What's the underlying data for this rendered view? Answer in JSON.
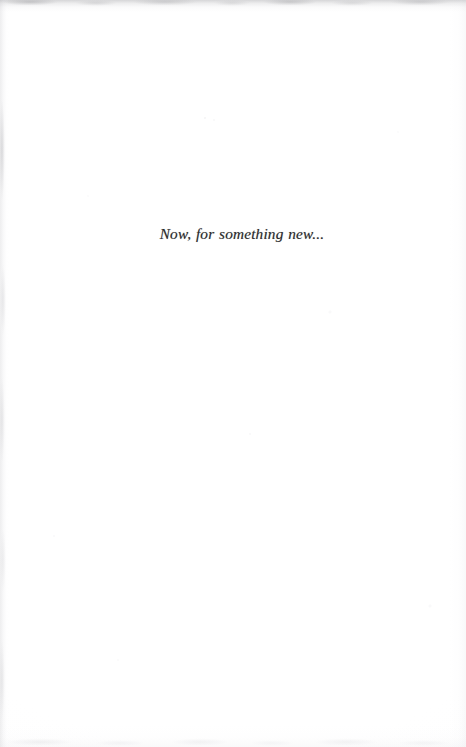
{
  "page": {
    "kind": "scanned-book-page",
    "background_color": "#fefefe",
    "width": 466,
    "height": 747
  },
  "content": {
    "epigraph": "Now, for something new...",
    "text_color": "#2b2b2d",
    "style": "serif-italic",
    "alignment": "center"
  },
  "artifacts": {
    "top_edge_label": "",
    "left_edge_label": "",
    "right_edge_label": "",
    "bottom_edge_label": ""
  }
}
